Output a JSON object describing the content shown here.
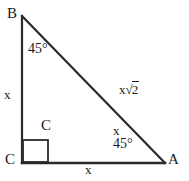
{
  "figure": {
    "type": "right-triangle",
    "stroke_color": "#2b2b2b",
    "background_color": "#ffffff",
    "text_color": "#1a1a1a"
  },
  "vertices": {
    "b": "B",
    "c": "C",
    "a": "A",
    "right_angle_marker_label": "C"
  },
  "sides": {
    "vertical_leg": "x",
    "horizontal_leg": "x",
    "hypotenuse_base": "x",
    "hypotenuse_radical": "2",
    "hypotenuse_full": "x√2"
  },
  "angles": {
    "at_b": "45°",
    "at_a": "45°",
    "at_a_side_mark": "x"
  },
  "geometry": {
    "b_point": [
      22,
      16
    ],
    "c_point": [
      22,
      163
    ],
    "a_point": [
      165,
      163
    ],
    "right_angle_box": [
      22,
      140,
      26,
      23
    ]
  }
}
